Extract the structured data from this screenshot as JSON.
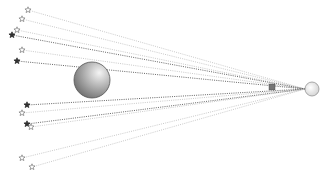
{
  "diagram": {
    "title": "",
    "width": 329,
    "height": 179,
    "observer": {
      "x": 312,
      "y": 89,
      "r": 7,
      "fill": "#e6e6e6",
      "stroke": "#888888"
    },
    "lens_sphere": {
      "x": 92,
      "y": 80,
      "r": 18,
      "gradient_light": "#f2f2f2",
      "gradient_dark": "#777777",
      "stroke": "#555555"
    },
    "small_cube": {
      "x": 272,
      "y": 87,
      "size": 6,
      "fill": "#777777"
    },
    "line_colors": {
      "light": "#bbbbbb",
      "dark": "#555555"
    },
    "stars": [
      {
        "x": 28,
        "y": 10,
        "filled": false
      },
      {
        "x": 22,
        "y": 19,
        "filled": false
      },
      {
        "x": 17,
        "y": 30,
        "filled": false
      },
      {
        "x": 12,
        "y": 35,
        "filled": true
      },
      {
        "x": 22,
        "y": 50,
        "filled": false
      },
      {
        "x": 17,
        "y": 61,
        "filled": true
      },
      {
        "x": 27,
        "y": 105,
        "filled": true
      },
      {
        "x": 22,
        "y": 113,
        "filled": false
      },
      {
        "x": 27,
        "y": 124,
        "filled": true
      },
      {
        "x": 31,
        "y": 127,
        "filled": false
      },
      {
        "x": 22,
        "y": 158,
        "filled": false
      },
      {
        "x": 32,
        "y": 167,
        "filled": false
      }
    ]
  }
}
